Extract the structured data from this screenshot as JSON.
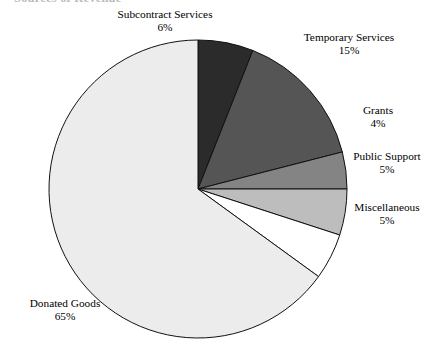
{
  "figure": {
    "clipped_title_fragment": "Sources of Revenue",
    "width": 430,
    "height": 350
  },
  "chart_data": {
    "type": "pie",
    "title": "",
    "xlabel": "",
    "ylabel": "",
    "legend_position": "none",
    "grid": false,
    "label_format": "name + percent",
    "start_angle_deg": 0,
    "direction": "clockwise",
    "center": {
      "x": 198,
      "y": 189
    },
    "radius": 149,
    "categories": [
      "Subcontract Services",
      "Temporary Services",
      "Grants",
      "Public Support",
      "Miscellaneous",
      "Donated Goods"
    ],
    "values": [
      6,
      15,
      4,
      5,
      5,
      65
    ],
    "value_labels": [
      "6%",
      "15%",
      "4%",
      "5%",
      "5%",
      "65%"
    ],
    "colors": [
      "#2b2b2b",
      "#555555",
      "#848484",
      "#bdbdbd",
      "#ffffff",
      "#ececec"
    ],
    "edge_color": "#111111",
    "slices": [
      {
        "name": "Subcontract Services",
        "value": 6,
        "value_label": "6%",
        "color": "#2b2b2b",
        "label_name": "Subcontract Services",
        "label_pct": "6%"
      },
      {
        "name": "Temporary Services",
        "value": 15,
        "value_label": "15%",
        "color": "#555555",
        "label_name": "Temporary Services",
        "label_pct": "15%"
      },
      {
        "name": "Grants",
        "value": 4,
        "value_label": "4%",
        "color": "#848484",
        "label_name": "Grants",
        "label_pct": "4%"
      },
      {
        "name": "Public Support",
        "value": 5,
        "value_label": "5%",
        "color": "#bdbdbd",
        "label_name": "Public Support",
        "label_pct": "5%"
      },
      {
        "name": "Miscellaneous",
        "value": 5,
        "value_label": "5%",
        "color": "#ffffff",
        "label_name": "Miscellaneous",
        "label_pct": "5%"
      },
      {
        "name": "Donated Goods",
        "value": 65,
        "value_label": "65%",
        "color": "#ececec",
        "label_name": "Donated Goods",
        "label_pct": "65%"
      }
    ]
  }
}
